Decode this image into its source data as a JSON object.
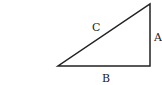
{
  "diagram": {
    "type": "right-triangle",
    "labels": {
      "hypotenuse": "C",
      "vertical_side": "A",
      "base": "B"
    },
    "stroke_color": "#222222"
  }
}
